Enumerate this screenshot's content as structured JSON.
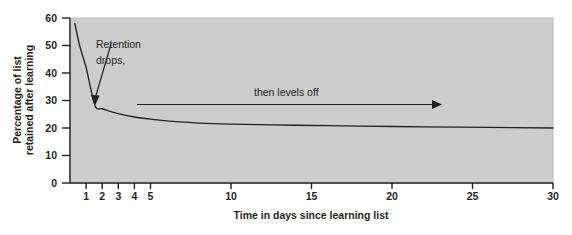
{
  "chart_data": {
    "type": "line",
    "title": "",
    "subtitle": "",
    "xlabel": "Time in days since learning list",
    "ylabel": "Percentage of list retained after learning",
    "ylabel_line1": "Percentage of list",
    "ylabel_line2": "retained after learning",
    "xlim": [
      0,
      30
    ],
    "ylim": [
      0,
      60
    ],
    "xticks": [
      1,
      2,
      3,
      4,
      5,
      10,
      15,
      20,
      25,
      30
    ],
    "xtick_labels": [
      "1",
      "2",
      "3",
      "4",
      "5",
      "10",
      "15",
      "20",
      "25",
      "30"
    ],
    "yticks": [
      0,
      10,
      20,
      30,
      40,
      50,
      60
    ],
    "ytick_labels": [
      "0",
      "10",
      "20",
      "30",
      "40",
      "50",
      "60"
    ],
    "grid": false,
    "legend_position": "none",
    "plot_background": "#cdcdcd",
    "line_color": "#231f20",
    "series": [
      {
        "name": "Retention curve (Ebbinghaus forgetting curve)",
        "x": [
          0.3,
          0.6,
          1.0,
          1.3,
          1.6,
          2.0,
          2.5,
          3.0,
          4.0,
          5.0,
          6.0,
          8.0,
          10.0,
          14.0,
          18.0,
          22.0,
          26.0,
          30.0
        ],
        "values": [
          58,
          50,
          42,
          34,
          27.5,
          27,
          26,
          25.2,
          24,
          23.2,
          22.6,
          21.8,
          21.4,
          21.0,
          20.7,
          20.4,
          20.2,
          20.0
        ]
      }
    ],
    "annotations": [
      {
        "name": "retention-drops-annotation",
        "text_line1": "Retention",
        "text_line2": "drops,",
        "arrow": "down-left"
      },
      {
        "name": "then-levels-off-annotation",
        "text": "then levels off",
        "arrow": "right"
      }
    ]
  }
}
